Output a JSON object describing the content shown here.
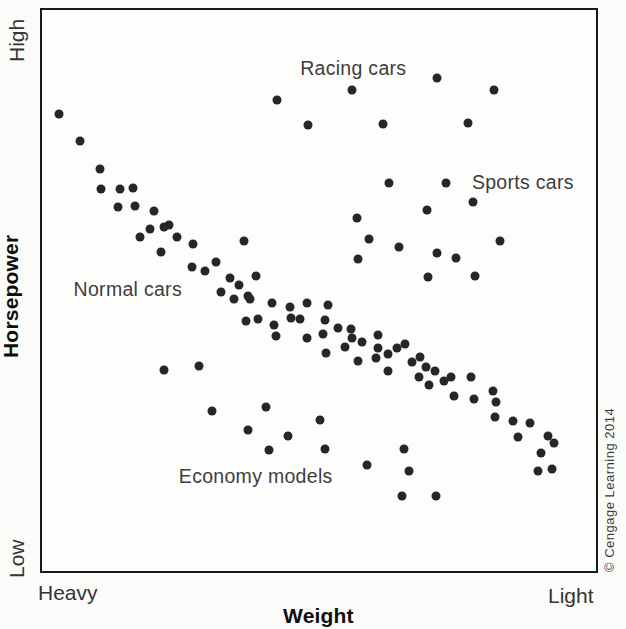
{
  "axes": {
    "y_title": "Horsepower",
    "y_top": "High",
    "y_bottom": "Low",
    "x_title": "Weight",
    "x_left": "Heavy",
    "x_right": "Light"
  },
  "credit": "© Cengage Learning 2014",
  "style": {
    "dot_color": "#262626",
    "frame_color": "#1a1a1a",
    "annotation_color": "#3d3d3d",
    "background": "#fbfbfa"
  },
  "chart_data": {
    "type": "scatter",
    "title": "",
    "xlabel": "Weight",
    "ylabel": "Horsepower",
    "x_axis_endpoints": [
      "Heavy",
      "Light"
    ],
    "y_axis_endpoints": [
      "Low",
      "High"
    ],
    "grid": false,
    "legend": false,
    "point_coords": "percent of plot area from top-left; x: 0=Heavy edge, 100=Light edge; y: 0=High edge, 100=Low edge",
    "annotations": [
      {
        "id": "racing",
        "label": "Racing cars",
        "x": 46.6,
        "y": 8.3
      },
      {
        "id": "sports",
        "label": "Sports cars",
        "x": 77.6,
        "y": 28.7
      },
      {
        "id": "normal",
        "label": "Normal cars",
        "x": 5.7,
        "y": 47.8
      },
      {
        "id": "economy",
        "label": "Economy models",
        "x": 24.7,
        "y": 81.1
      }
    ],
    "clusters": [
      {
        "name": "main diagonal band (normal cars trend)",
        "points": [
          [
            3.0,
            18.6
          ],
          [
            6.8,
            23.4
          ],
          [
            10.4,
            28.3
          ],
          [
            10.6,
            31.9
          ],
          [
            14.0,
            31.9
          ],
          [
            16.5,
            31.7
          ],
          [
            13.8,
            35.2
          ],
          [
            16.8,
            34.9
          ],
          [
            20.3,
            35.9
          ],
          [
            19.5,
            39.1
          ],
          [
            22.0,
            38.6
          ],
          [
            22.9,
            38.4
          ],
          [
            17.6,
            40.5
          ],
          [
            24.4,
            40.5
          ],
          [
            21.5,
            43.2
          ],
          [
            27.2,
            41.8
          ],
          [
            36.4,
            41.2
          ],
          [
            27.1,
            45.8
          ],
          [
            29.4,
            46.5
          ],
          [
            31.4,
            45.0
          ],
          [
            33.9,
            47.8
          ],
          [
            35.5,
            49.0
          ],
          [
            32.3,
            50.3
          ],
          [
            34.6,
            51.5
          ],
          [
            37.1,
            51.0
          ],
          [
            38.7,
            47.4
          ],
          [
            37.6,
            51.5
          ],
          [
            41.6,
            52.2
          ],
          [
            44.8,
            52.9
          ],
          [
            47.8,
            52.2
          ],
          [
            51.6,
            52.6
          ],
          [
            36.9,
            55.4
          ],
          [
            38.9,
            55.0
          ],
          [
            41.8,
            56.1
          ],
          [
            45.0,
            54.9
          ],
          [
            46.6,
            55.0
          ],
          [
            42.3,
            58.1
          ],
          [
            47.8,
            58.4
          ],
          [
            51.1,
            55.2
          ],
          [
            50.7,
            57.7
          ],
          [
            53.4,
            56.6
          ],
          [
            55.7,
            56.8
          ],
          [
            55.9,
            58.4
          ],
          [
            57.7,
            59.1
          ],
          [
            51.3,
            61.1
          ],
          [
            54.7,
            60.0
          ],
          [
            60.6,
            57.9
          ],
          [
            60.6,
            60.2
          ],
          [
            57.0,
            62.5
          ],
          [
            60.2,
            62.1
          ],
          [
            64.0,
            60.2
          ],
          [
            65.6,
            59.6
          ],
          [
            62.5,
            61.4
          ],
          [
            62.4,
            64.4
          ],
          [
            66.8,
            62.8
          ],
          [
            68.3,
            61.8
          ],
          [
            69.4,
            63.7
          ],
          [
            68.1,
            65.5
          ],
          [
            71.0,
            64.4
          ],
          [
            69.9,
            66.9
          ],
          [
            72.6,
            66.2
          ],
          [
            73.8,
            65.5
          ],
          [
            77.4,
            65.5
          ],
          [
            74.4,
            68.8
          ],
          [
            78.0,
            69.4
          ],
          [
            81.4,
            68.0
          ],
          [
            81.9,
            69.9
          ],
          [
            81.7,
            72.6
          ],
          [
            85.1,
            73.3
          ],
          [
            88.0,
            73.6
          ],
          [
            86.0,
            76.1
          ],
          [
            91.4,
            75.9
          ],
          [
            92.5,
            77.2
          ],
          [
            90.1,
            78.9
          ],
          [
            89.6,
            82.1
          ],
          [
            92.1,
            81.9
          ]
        ]
      },
      {
        "name": "racing cars",
        "points": [
          [
            42.5,
            16.1
          ],
          [
            48.0,
            20.5
          ],
          [
            55.9,
            14.2
          ],
          [
            71.3,
            12.2
          ],
          [
            81.5,
            14.3
          ],
          [
            61.6,
            20.4
          ],
          [
            76.9,
            20.2
          ]
        ]
      },
      {
        "name": "sports cars",
        "points": [
          [
            62.7,
            30.8
          ],
          [
            72.9,
            30.8
          ],
          [
            77.8,
            34.3
          ],
          [
            56.8,
            37.0
          ],
          [
            69.5,
            35.6
          ],
          [
            59.1,
            40.9
          ],
          [
            64.5,
            42.3
          ],
          [
            71.3,
            43.4
          ],
          [
            74.7,
            44.2
          ],
          [
            57.0,
            44.4
          ],
          [
            82.6,
            41.2
          ],
          [
            69.7,
            47.6
          ],
          [
            78.1,
            47.4
          ]
        ]
      },
      {
        "name": "economy models",
        "points": [
          [
            22.0,
            64.2
          ],
          [
            28.3,
            63.5
          ],
          [
            30.6,
            71.5
          ],
          [
            40.5,
            70.8
          ],
          [
            37.1,
            74.9
          ],
          [
            44.4,
            75.9
          ],
          [
            41.0,
            78.4
          ],
          [
            50.2,
            73.1
          ],
          [
            51.1,
            78.2
          ],
          [
            58.6,
            81.1
          ],
          [
            65.4,
            78.2
          ],
          [
            66.3,
            82.1
          ],
          [
            64.9,
            86.7
          ],
          [
            71.1,
            86.7
          ]
        ]
      }
    ]
  }
}
